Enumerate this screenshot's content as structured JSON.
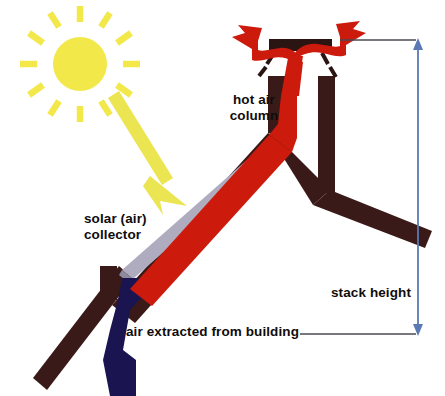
{
  "diagram": {
    "background_color": "#ffffff",
    "labels": {
      "hot_air_column": "hot air\ncolumn",
      "solar_collector": "solar (air)\ncollector",
      "air_extracted": "air extracted from building",
      "stack_height": "stack height"
    },
    "colors": {
      "sun": "#f2e84a",
      "sun_ray": "#f2e84a",
      "sun_arrow": "#eae64f",
      "hot_air_red": "#cc1a0d",
      "cool_air_blue": "#1a1450",
      "structure_brown": "#3a1a18",
      "collector_panel": "#b0acc0",
      "collector_edge": "#8d8a9e",
      "dimension_blue": "#5b79b4",
      "leader_gray": "#4a4a52",
      "text": "#100c0a"
    },
    "elements": [
      {
        "name": "sun",
        "type": "sun-with-rays",
        "center_x": 80,
        "center_y": 64,
        "radius": 27,
        "ray_count": 12
      },
      {
        "name": "solar-ray-arrow",
        "type": "arrow",
        "from_x": 113,
        "from_y": 105,
        "to_x": 188,
        "to_y": 203
      },
      {
        "name": "solar-collector-panel",
        "type": "panel"
      },
      {
        "name": "hot-air-duct",
        "type": "duct",
        "color_role": "hot_air_red"
      },
      {
        "name": "extracted-air-duct",
        "type": "duct",
        "color_role": "cool_air_blue"
      },
      {
        "name": "roof-structure",
        "type": "structure"
      },
      {
        "name": "chimney-stack",
        "type": "structure"
      },
      {
        "name": "chimney-cap",
        "type": "cap"
      },
      {
        "name": "damper-blades",
        "type": "blades",
        "count": 4
      },
      {
        "name": "exhaust-arrow-left",
        "type": "arrow"
      },
      {
        "name": "exhaust-arrow-right",
        "type": "arrow"
      },
      {
        "name": "stack-height-dimension",
        "type": "dimension-line",
        "top_y": 40,
        "bottom_y": 334,
        "x": 418
      },
      {
        "name": "leader-line-top",
        "type": "leader",
        "from_x": 340,
        "to_x": 418,
        "y": 40
      },
      {
        "name": "leader-line-bottom",
        "type": "leader",
        "from_x": 300,
        "to_x": 418,
        "y": 334
      }
    ]
  }
}
